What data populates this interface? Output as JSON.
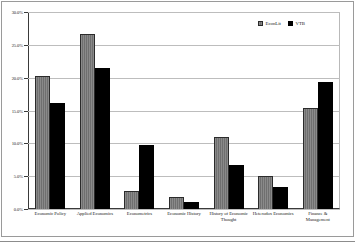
{
  "chart_data": {
    "type": "bar",
    "title": "",
    "subtitle": "",
    "xlabel": "",
    "ylabel": "",
    "ylim": [
      0,
      30
    ],
    "ytick_labels": [
      "0.0%",
      "5.0%",
      "10.0%",
      "15.0%",
      "20.0%",
      "25.0%",
      "30.0%"
    ],
    "ytick_values": [
      0,
      5,
      10,
      15,
      20,
      25,
      30
    ],
    "grid": true,
    "legend_position": "top-right",
    "categories": [
      "Economic Policy",
      "Applied Economics",
      "Econometrics",
      "Economic History",
      "History of Economic Thought",
      "Heterodox Economics",
      "Finance & Management"
    ],
    "series": [
      {
        "name": "EconLit",
        "color": "#7d7d7d",
        "values": [
          20.3,
          26.6,
          2.8,
          1.8,
          11.0,
          5.1,
          15.4
        ]
      },
      {
        "name": "VTB",
        "color": "#000000",
        "values": [
          16.2,
          21.4,
          9.7,
          1.1,
          6.7,
          3.3,
          19.4
        ]
      }
    ]
  },
  "legend": {
    "items": [
      {
        "label": "EconLit"
      },
      {
        "label": "VTB"
      }
    ]
  },
  "colors": {
    "series_econlit": "#7d7d7d",
    "series_vtb": "#000000",
    "gridline": "#bdbdbd",
    "axis": "#3a3a3a",
    "frame": "#9a9a9a"
  }
}
